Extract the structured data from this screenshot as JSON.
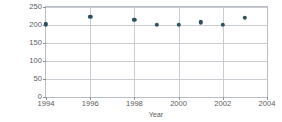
{
  "chart_data": {
    "type": "scatter",
    "title": "",
    "xlabel": "Year",
    "ylabel": "Farm output (billions of dollars)",
    "xlim": [
      1994,
      2004
    ],
    "ylim": [
      0,
      250
    ],
    "xticks": [
      1994,
      1996,
      1998,
      2000,
      2002,
      2004
    ],
    "yticks": [
      0,
      50,
      100,
      150,
      200,
      250
    ],
    "grid": true,
    "legend": "none",
    "marker_color": "#2f4f60",
    "x": [
      1994,
      1996,
      1998,
      1999,
      2000,
      2001,
      2002,
      2003
    ],
    "values": [
      202,
      222,
      214,
      200,
      200,
      208,
      200,
      220
    ],
    "points": [
      {
        "year": 1994,
        "output": 202
      },
      {
        "year": 1996,
        "output": 222
      },
      {
        "year": 1998,
        "output": 214
      },
      {
        "year": 1999,
        "output": 200
      },
      {
        "year": 2000,
        "output": 200
      },
      {
        "year": 2001,
        "output": 208
      },
      {
        "year": 2002,
        "output": 200
      },
      {
        "year": 2003,
        "output": 220
      }
    ]
  },
  "axes": {
    "y_title": "Farm output (billions of dollars)",
    "x_title": "Year"
  }
}
